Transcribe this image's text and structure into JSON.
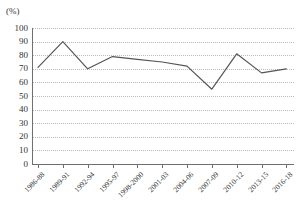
{
  "chart_data": {
    "type": "line",
    "title": "",
    "xlabel": "",
    "ylabel": "(%)",
    "unit_label": "(%)",
    "categories": [
      "1986-88",
      "1989-91",
      "1992-94",
      "1995-97",
      "1998-2000",
      "2001-03",
      "2004-06",
      "2007-09",
      "2010-12",
      "2013-15",
      "2016-18"
    ],
    "values": [
      71,
      90,
      70,
      79,
      77,
      75,
      72,
      55,
      81,
      67,
      70
    ],
    "series": [
      {
        "name": "",
        "values": [
          71,
          90,
          70,
          79,
          77,
          75,
          72,
          55,
          81,
          67,
          70
        ]
      }
    ],
    "ylim": [
      0,
      100
    ],
    "ytick_labels": [
      "100",
      "90",
      "80",
      "70",
      "60",
      "50",
      "40",
      "30",
      "20",
      "10",
      "0"
    ],
    "ytick_values": [
      100,
      90,
      80,
      70,
      60,
      50,
      40,
      30,
      20,
      10,
      0
    ],
    "grid": true,
    "grid_style": "dotted-horizontal",
    "legend": "none",
    "line_color": "#555555",
    "grid_color": "#b9b9b9",
    "axis_color": "#6f6f6f"
  }
}
